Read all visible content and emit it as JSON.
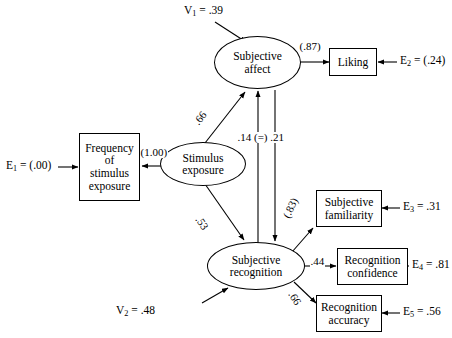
{
  "diagram": {
    "type": "path-diagram",
    "stroke_color": "#000000",
    "background_color": "#ffffff"
  },
  "latent_variables": [
    {
      "id": "stimulus_exposure",
      "label_line1": "Stimulus",
      "label_line2": "exposure"
    },
    {
      "id": "subjective_affect",
      "label_line1": "Subjective",
      "label_line2": "affect"
    },
    {
      "id": "subjective_recognition",
      "label_line1": "Subjective",
      "label_line2": "recognition"
    }
  ],
  "observed_variables": [
    {
      "id": "frequency_of_stimulus_exposure",
      "line1": "Frequency",
      "line2": "of",
      "line3": "stimulus",
      "line4": "exposure"
    },
    {
      "id": "liking",
      "line1": "Liking",
      "line2": ""
    },
    {
      "id": "subjective_familiarity",
      "line1": "Subjective",
      "line2": "familiarity"
    },
    {
      "id": "recognition_confidence",
      "line1": "Recognition",
      "line2": "confidence"
    },
    {
      "id": "recognition_accuracy",
      "line1": "Recognition",
      "line2": "accuracy"
    }
  ],
  "error_terms": [
    {
      "id": "e1",
      "name": "E",
      "sub": "1",
      "eq": " = (.00)",
      "value": "(.00)"
    },
    {
      "id": "e2",
      "name": "E",
      "sub": "2",
      "eq": " = (.24)",
      "value": "(.24)"
    },
    {
      "id": "e3",
      "name": "E",
      "sub": "3",
      "eq": " = .31",
      "value": ".31"
    },
    {
      "id": "e4",
      "name": "E",
      "sub": "4",
      "eq": " = .81",
      "value": ".81"
    },
    {
      "id": "e5",
      "name": "E",
      "sub": "5",
      "eq": " = .56",
      "value": ".56"
    }
  ],
  "disturbance_terms": [
    {
      "id": "v1",
      "name": "V",
      "sub": "1",
      "eq": " = .39",
      "value": ".39"
    },
    {
      "id": "v2",
      "name": "V",
      "sub": "2",
      "eq": " = .48",
      "value": ".48"
    }
  ],
  "path_coefficients": [
    {
      "id": "p_exposure_to_frequency",
      "label": "(1.00)",
      "from": "stimulus_exposure",
      "to": "frequency_of_stimulus_exposure"
    },
    {
      "id": "p_exposure_to_affect",
      "label": ".66",
      "from": "stimulus_exposure",
      "to": "subjective_affect"
    },
    {
      "id": "p_exposure_to_recognition",
      "label": ".53",
      "from": "stimulus_exposure",
      "to": "subjective_recognition"
    },
    {
      "id": "p_reciprocal",
      "label": ".14 (=) .21",
      "from": "subjective_recognition",
      "to": "subjective_affect"
    },
    {
      "id": "p_affect_to_liking",
      "label": "(.87)",
      "from": "subjective_affect",
      "to": "liking"
    },
    {
      "id": "p_recognition_to_familiarity",
      "label": "(.83)",
      "from": "subjective_recognition",
      "to": "subjective_familiarity"
    },
    {
      "id": "p_recognition_to_confidence",
      "label": ".44",
      "from": "subjective_recognition",
      "to": "recognition_confidence"
    },
    {
      "id": "p_recognition_to_accuracy",
      "label": ".66",
      "from": "subjective_recognition",
      "to": "recognition_accuracy"
    }
  ]
}
